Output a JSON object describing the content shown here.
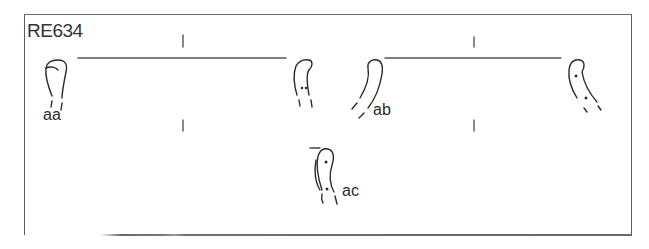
{
  "figure": {
    "title": "RE634",
    "labels": {
      "aa": "aa",
      "ab": "ab",
      "ac": "ac"
    },
    "colors": {
      "ink": "#2a2a2a",
      "frame": "#5a5a5a",
      "background": "#ffffff"
    }
  }
}
